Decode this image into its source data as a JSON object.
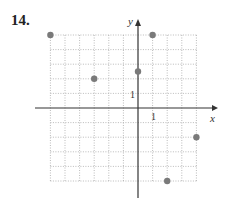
{
  "problem": {
    "number": "14."
  },
  "axes": {
    "x_label": "x",
    "y_label": "y",
    "x_tick_label": "1",
    "y_tick_label": "1"
  },
  "grid": {
    "x_min": -6,
    "x_max": 4,
    "y_min": -5,
    "y_max": 5
  },
  "points": [
    {
      "x": -6,
      "y": 5
    },
    {
      "x": 1,
      "y": 5
    },
    {
      "x": 0,
      "y": 2.5
    },
    {
      "x": -3,
      "y": 2
    },
    {
      "x": 4,
      "y": -2
    },
    {
      "x": 2,
      "y": -5
    }
  ],
  "colors": {
    "point": "#7a7a7a",
    "axis": "#333333",
    "grid": "#aaaaaa"
  }
}
